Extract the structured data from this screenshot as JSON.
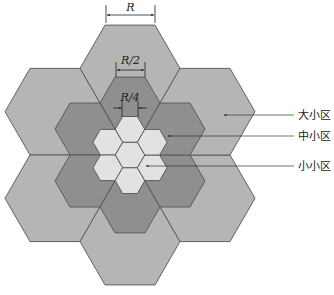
{
  "diagram": {
    "type": "hierarchical-hexagonal-cell-layout",
    "colors": {
      "large_cell": "#b5b5b5",
      "medium_cell": "#8f8f8f",
      "small_cell": "#e2e2e2",
      "stroke": "#555555",
      "line": "#333333"
    },
    "dimensions": [
      {
        "label": "R",
        "x1": 106,
        "x2": 155,
        "y": 15,
        "ext_top": 5,
        "ext_bottom": 23,
        "label_y": 11,
        "arrows": "inward"
      },
      {
        "label": "R/2",
        "x1": 116,
        "x2": 145,
        "y": 70,
        "ext_top": 62,
        "ext_bottom": 77,
        "label_y": 64,
        "arrows": "inward"
      },
      {
        "label": "R/4",
        "x1": 122,
        "x2": 138,
        "y": 108,
        "ext_top": 101,
        "ext_bottom": 117,
        "label_y": 101,
        "arrows": "outward"
      }
    ],
    "labels": [
      {
        "text": "大小区",
        "line_y": 115,
        "arrow_x": 224
      },
      {
        "text": "中小区",
        "line_y": 136,
        "arrow_x": 168
      },
      {
        "text": "小小区",
        "line_y": 166,
        "arrow_x": 146
      }
    ]
  }
}
